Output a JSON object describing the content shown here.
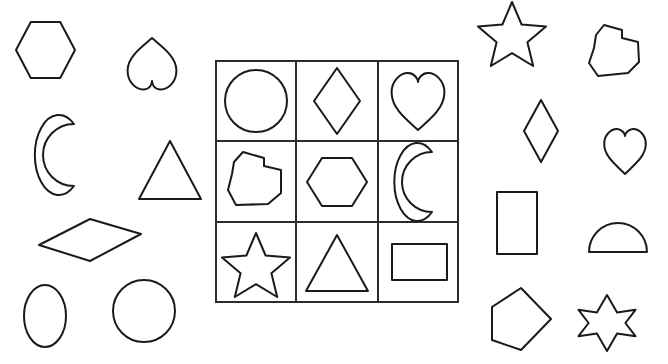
{
  "page": {
    "background_color": "#ffffff",
    "stroke_color": "#1a1a1a",
    "stroke_width": 2,
    "width": 668,
    "height": 364
  },
  "grid": {
    "name": "shape-grid",
    "rows": 3,
    "columns": 3,
    "x": 216,
    "y": 61,
    "width": 242,
    "height": 241,
    "border_color": "#2b2b2b",
    "cells": [
      {
        "row": 0,
        "col": 0,
        "shape": "circle",
        "label": "circle"
      },
      {
        "row": 0,
        "col": 1,
        "shape": "diamond",
        "label": "diamond"
      },
      {
        "row": 0,
        "col": 2,
        "shape": "heart",
        "label": "heart"
      },
      {
        "row": 1,
        "col": 0,
        "shape": "irregular-polygon",
        "label": "irregular blob"
      },
      {
        "row": 1,
        "col": 1,
        "shape": "hexagon",
        "label": "hexagon"
      },
      {
        "row": 1,
        "col": 2,
        "shape": "crescent-moon",
        "label": "crescent moon"
      },
      {
        "row": 2,
        "col": 0,
        "shape": "five-point-star",
        "label": "five point star"
      },
      {
        "row": 2,
        "col": 1,
        "shape": "triangle",
        "label": "triangle"
      },
      {
        "row": 2,
        "col": 2,
        "shape": "rectangle",
        "label": "rectangle"
      }
    ]
  },
  "loose_shapes": {
    "left": [
      {
        "shape": "hexagon",
        "label": "hexagon",
        "x": 14,
        "y": 22,
        "width": 63,
        "height": 56
      },
      {
        "shape": "heart-inverted",
        "label": "inverted heart",
        "x": 127,
        "y": 38,
        "width": 50,
        "height": 52
      },
      {
        "shape": "crescent-moon-left",
        "label": "crescent moon, mirrored",
        "x": 50,
        "y": 124,
        "width": 48,
        "height": 62
      },
      {
        "shape": "triangle",
        "label": "triangle",
        "x": 139,
        "y": 141,
        "width": 62,
        "height": 58
      },
      {
        "shape": "diamond-flat",
        "label": "flat diamond",
        "x": 39,
        "y": 219,
        "width": 102,
        "height": 42
      },
      {
        "shape": "ellipse",
        "label": "ellipse",
        "x": 24,
        "y": 285,
        "width": 42,
        "height": 62
      },
      {
        "shape": "circle",
        "label": "circle",
        "x": 113,
        "y": 280,
        "width": 62,
        "height": 62
      }
    ],
    "right": [
      {
        "shape": "five-point-star",
        "label": "five point star",
        "x": 480,
        "y": 2,
        "width": 64,
        "height": 62
      },
      {
        "shape": "irregular-polygon",
        "label": "irregular blob",
        "x": 588,
        "y": 25,
        "width": 62,
        "height": 52
      },
      {
        "shape": "diamond",
        "label": "diamond",
        "x": 524,
        "y": 100,
        "width": 34,
        "height": 62
      },
      {
        "shape": "heart",
        "label": "heart",
        "x": 604,
        "y": 124,
        "width": 42,
        "height": 50
      },
      {
        "shape": "rectangle-vertical",
        "label": "vertical rectangle",
        "x": 497,
        "y": 192,
        "width": 40,
        "height": 62
      },
      {
        "shape": "semicircle",
        "label": "semicircle",
        "x": 589,
        "y": 222,
        "width": 58,
        "height": 30
      },
      {
        "shape": "pentagon",
        "label": "pentagon rotated",
        "x": 489,
        "y": 288,
        "width": 62,
        "height": 62
      },
      {
        "shape": "six-point-star",
        "label": "six point star",
        "x": 579,
        "y": 295,
        "width": 56,
        "height": 56
      }
    ]
  }
}
